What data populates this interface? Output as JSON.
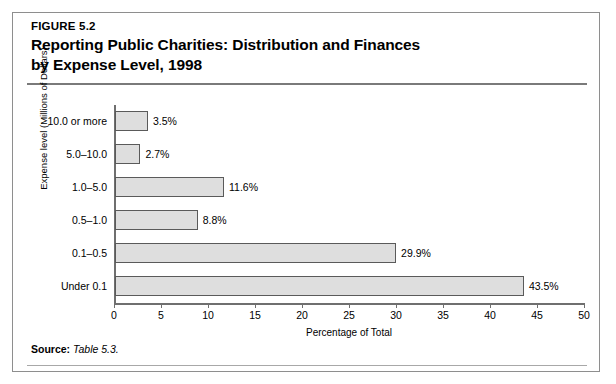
{
  "figure": {
    "label": "FIGURE 5.2",
    "title_line1": "Reporting Public Charities: Distribution and Finances",
    "title_line2": "by Expense Level, 1998",
    "source_label": "Source:",
    "source_text": "Table 5.3."
  },
  "chart_data": {
    "type": "bar",
    "orientation": "horizontal",
    "title": "Reporting Public Charities: Distribution and Finances by Expense Level, 1998",
    "xlabel": "Percentage of Total",
    "ylabel": "Expense level (Millions of Dollars)",
    "xlim": [
      0,
      50
    ],
    "xticks": [
      0,
      5,
      10,
      15,
      20,
      25,
      30,
      35,
      40,
      45,
      50
    ],
    "xtick_labels": [
      "0",
      "5",
      "10",
      "15",
      "20",
      "25",
      "30",
      "35",
      "40",
      "45",
      "50"
    ],
    "grid": false,
    "legend": null,
    "categories": [
      "Under 0.1",
      "0.1–0.5",
      "0.5–1.0",
      "1.0–5.0",
      "5.0–10.0",
      "10.0 or more"
    ],
    "values": [
      43.5,
      29.9,
      8.8,
      11.6,
      2.7,
      3.5
    ],
    "data_labels": [
      "43.5%",
      "29.9%",
      "8.8%",
      "11.6%",
      "2.7%",
      "3.5%"
    ],
    "bar_color": "#dedede",
    "bar_border_color": "#5a5a5a",
    "rows_top_to_bottom": [
      {
        "category": "10.0 or more",
        "value": 3.5,
        "label": "3.5%"
      },
      {
        "category": "5.0–10.0",
        "value": 2.7,
        "label": "2.7%"
      },
      {
        "category": "1.0–5.0",
        "value": 11.6,
        "label": "11.6%"
      },
      {
        "category": "0.5–1.0",
        "value": 8.8,
        "label": "8.8%"
      },
      {
        "category": "0.1–0.5",
        "value": 29.9,
        "label": "29.9%"
      },
      {
        "category": "Under 0.1",
        "value": 43.5,
        "label": "43.5%"
      }
    ]
  }
}
